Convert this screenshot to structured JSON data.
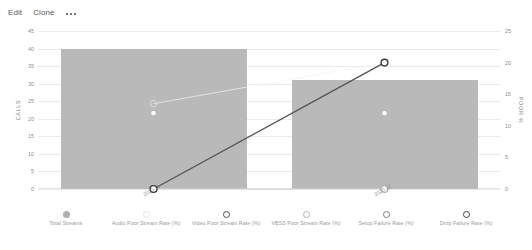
{
  "toolbar": {
    "edit_label": "Edit",
    "clone_label": "Clone",
    "more_label": "•••"
  },
  "chart_data": {
    "type": "bar",
    "title": "",
    "xlabel": "",
    "ylabel": "CALLS",
    "y2label": "POOR %",
    "categories": [
      "2020-11",
      "2020-12"
    ],
    "grid": true,
    "legend_position": "bottom",
    "ylim": [
      0,
      45
    ],
    "yticks": [
      0,
      5,
      10,
      15,
      20,
      25,
      30,
      35,
      40,
      45
    ],
    "y2lim": [
      0,
      25
    ],
    "y2ticks": [
      0,
      5,
      10,
      15,
      20,
      25
    ],
    "series": [
      {
        "name": "Total Streams",
        "type": "bar",
        "axis": "left",
        "color": "#b9b9b9",
        "values": [
          40,
          31
        ]
      },
      {
        "name": "Audio Poor Stream Rate (%)",
        "type": "line",
        "axis": "right",
        "color": "#f2f2f2",
        "values": [
          13.5,
          20
        ]
      },
      {
        "name": "Video Poor Stream Rate (%)",
        "type": "line",
        "axis": "right",
        "color": "#ffffff",
        "values": [
          12,
          12
        ]
      },
      {
        "name": "VBSS Poor Stream Rate (%)",
        "type": "line",
        "axis": "right",
        "color": "#e8e8e8",
        "values": [
          0,
          0
        ]
      },
      {
        "name": "Setup Failure Rate (%)",
        "type": "line",
        "axis": "right",
        "color": "#cccccc",
        "values": [
          0,
          0
        ]
      },
      {
        "name": "Drop Failure Rate (%)",
        "type": "line",
        "axis": "right",
        "color": "#555555",
        "values": [
          0,
          20
        ]
      }
    ]
  },
  "legend": [
    {
      "label": "Total Streams",
      "marker": "filled-circle",
      "color": "#b0b0b0"
    },
    {
      "label": "Audio Poor Stream Rate (%)",
      "marker": "hollow-circle",
      "color": "#e3e3e3"
    },
    {
      "label": "Video Poor Stream Rate (%)",
      "marker": "hollow-circle",
      "color": "#4a4a4a"
    },
    {
      "label": "VBSS Poor Stream Rate (%)",
      "marker": "hollow-circle",
      "color": "#b4b4b4"
    },
    {
      "label": "Setup Failure Rate (%)",
      "marker": "hollow-circle",
      "color": "#7d7d7d"
    },
    {
      "label": "Drop Failure Rate (%)",
      "marker": "hollow-circle",
      "color": "#3c3c3c"
    }
  ]
}
